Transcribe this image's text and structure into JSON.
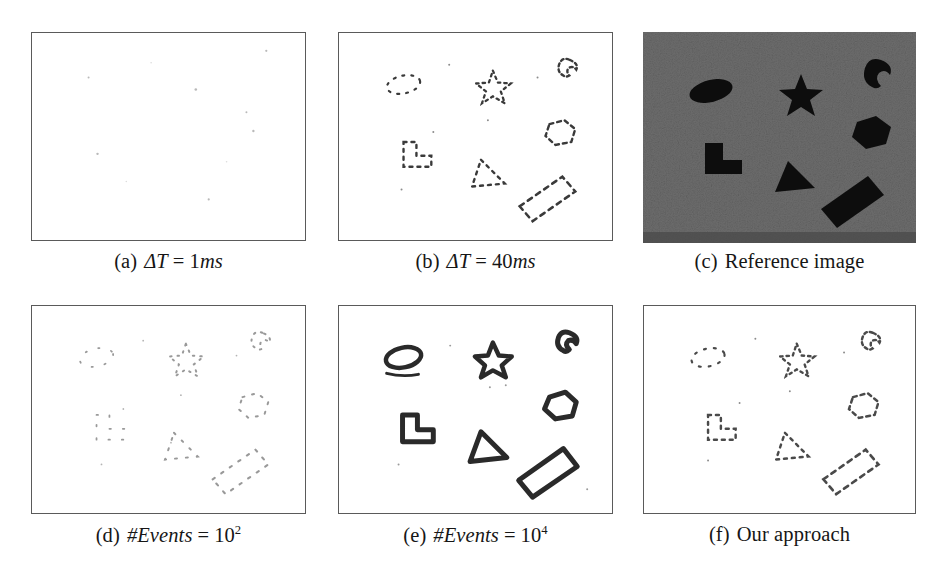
{
  "figure": {
    "background_color": "#ffffff",
    "frame_color": "#5a5a5a",
    "panel_count": 6,
    "rows": 2,
    "columns": 3
  },
  "panels": [
    {
      "id": "a",
      "tag": "(a)",
      "caption_parts": {
        "label": "(a)",
        "symbol": "ΔT",
        "operator": "=",
        "value": "1",
        "unit": "ms"
      },
      "caption_text": "(a) ΔT = 1ms",
      "kind": "event-frame",
      "background": "#ffffff",
      "description": "nearly empty white frame with a handful of faint scattered event dots",
      "event_density": "very-low"
    },
    {
      "id": "b",
      "tag": "(b)",
      "caption_parts": {
        "label": "(b)",
        "symbol": "ΔT",
        "operator": "=",
        "value": "40",
        "unit": "ms"
      },
      "caption_text": "(b) ΔT = 40ms",
      "kind": "event-frame",
      "background": "#ffffff",
      "description": "sparse fragmented dotted contours of seven shapes",
      "event_density": "low"
    },
    {
      "id": "c",
      "tag": "(c)",
      "caption_parts": {
        "label": "(c)",
        "symbol": "",
        "operator": "",
        "value": "",
        "unit": ""
      },
      "caption_text": "(c) Reference image",
      "kind": "grayscale-photo",
      "background": "#6d6d6d",
      "description": "noisy grey background with seven solid black shapes",
      "event_density": "n/a"
    },
    {
      "id": "d",
      "tag": "(d)",
      "caption_parts": {
        "label": "(d)",
        "symbol": "#Events",
        "operator": "=",
        "value": "10",
        "exponent": "2",
        "unit": ""
      },
      "caption_text": "(d) #Events = 10^2",
      "kind": "event-frame",
      "background": "#ffffff",
      "description": "very sparse scattered dots forming faint partial outlines",
      "event_density": "very-low"
    },
    {
      "id": "e",
      "tag": "(e)",
      "caption_parts": {
        "label": "(e)",
        "symbol": "#Events",
        "operator": "=",
        "value": "10",
        "exponent": "4",
        "unit": ""
      },
      "caption_text": "(e) #Events = 10^4",
      "kind": "event-frame",
      "background": "#ffffff",
      "description": "thick dark complete contours of all seven shapes",
      "event_density": "high"
    },
    {
      "id": "f",
      "tag": "(f)",
      "caption_parts": {
        "label": "(f)",
        "symbol": "",
        "operator": "",
        "value": "",
        "unit": ""
      },
      "caption_text": "(f) Our approach",
      "kind": "event-frame",
      "background": "#ffffff",
      "description": "sparse but well-distributed dotted contours of seven shapes",
      "event_density": "low-adaptive"
    }
  ],
  "captions": {
    "a": {
      "label": "(a)",
      "symbol": "ΔT",
      "op": "=",
      "num": "1",
      "unit": "ms"
    },
    "b": {
      "label": "(b)",
      "symbol": "ΔT",
      "op": "=",
      "num": "40",
      "unit": "ms"
    },
    "c": {
      "label": "(c)",
      "text": "Reference image"
    },
    "d": {
      "label": "(d)",
      "symbol": "#Events",
      "op": "=",
      "num": "10",
      "exp": "2"
    },
    "e": {
      "label": "(e)",
      "symbol": "#Events",
      "op": "=",
      "num": "10",
      "exp": "4"
    },
    "f": {
      "label": "(f)",
      "text": "Our approach"
    }
  },
  "scene": {
    "shape_count": 7,
    "shape_color": "#101010",
    "shapes": [
      {
        "name": "ellipse",
        "cx": 24,
        "cy": 26,
        "note": "tilted filled ellipse, upper left"
      },
      {
        "name": "star",
        "cx": 57,
        "cy": 22,
        "note": "five pointed star, upper middle"
      },
      {
        "name": "crescent",
        "cx": 88,
        "cy": 13,
        "note": "comma / crescent, upper right corner"
      },
      {
        "name": "hexagon",
        "cx": 82,
        "cy": 47,
        "note": "hexagon, right middle"
      },
      {
        "name": "l-shape",
        "cx": 25,
        "cy": 57,
        "note": "L shaped polygon, left middle"
      },
      {
        "name": "triangle",
        "cx": 54,
        "cy": 70,
        "note": "triangle, lower middle"
      },
      {
        "name": "rotated-rect",
        "cx": 78,
        "cy": 80,
        "note": "long rotated rectangle, lower right"
      }
    ]
  }
}
